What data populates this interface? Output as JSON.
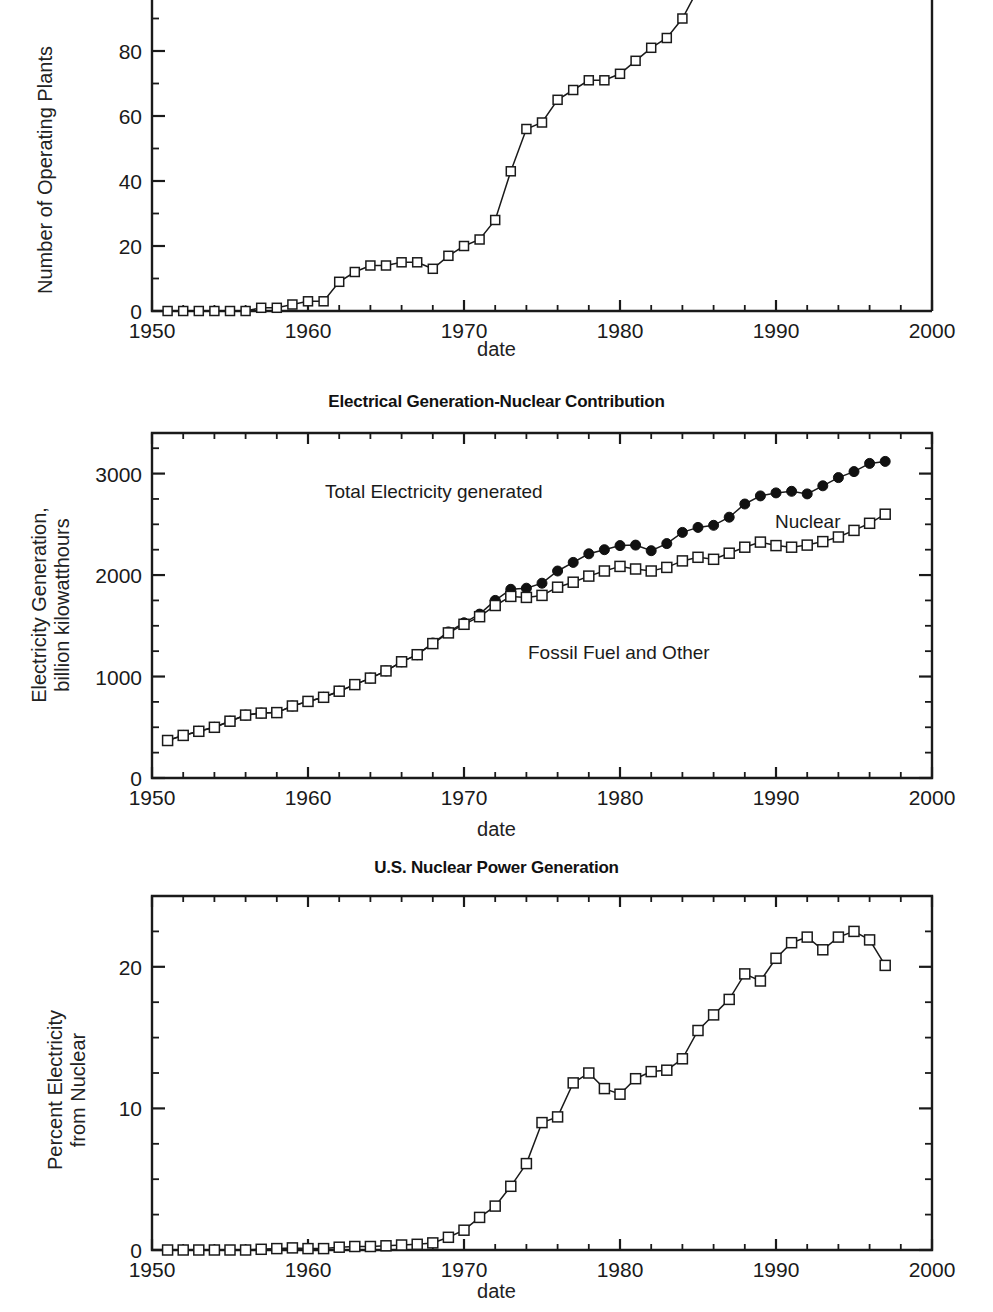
{
  "figure": {
    "background": "#ffffff",
    "line_color": "#1a1a1a",
    "marker_open_fill": "#ffffff",
    "marker_solid_fill": "#111111",
    "xlabel": "date"
  },
  "panels": [
    {
      "id": "operating-plants",
      "title": "",
      "xlabel": "date",
      "ylabel": "Number of Operating Plants",
      "ylabel_lines": [
        "Number of Operating Plants"
      ]
    },
    {
      "id": "electrical-generation",
      "title": "Electrical Generation-Nuclear Contribution",
      "xlabel": "date",
      "ylabel": "Electricity Generation, billion kilowatthours",
      "ylabel_lines": [
        "Electricity Generation,",
        "billion kilowatthours"
      ],
      "annotations": [
        {
          "name": "total-electricity-label",
          "text": "Total Electricity generated"
        },
        {
          "name": "nuclear-label",
          "text": "Nuclear"
        },
        {
          "name": "fossil-fuel-label",
          "text": "Fossil Fuel and Other"
        }
      ]
    },
    {
      "id": "nuclear-percent",
      "title": "U.S. Nuclear Power Generation",
      "xlabel": "date",
      "ylabel": "Percent Electricity from Nuclear",
      "ylabel_lines": [
        "Percent Electricity",
        "from Nuclear"
      ]
    }
  ],
  "chart_data": [
    {
      "type": "line",
      "id": "operating-plants",
      "title": "",
      "xlabel": "date",
      "ylabel": "Number of Operating Plants",
      "xlim": [
        1950,
        2000
      ],
      "ylim": [
        0,
        108
      ],
      "xticks": [
        1950,
        1960,
        1970,
        1980,
        1990,
        2000
      ],
      "xticklabels": [
        "1950",
        "1960",
        "1970",
        "1980",
        "1990",
        "2000"
      ],
      "yticks": [
        0,
        20,
        40,
        60,
        80,
        100
      ],
      "yticklabels": [
        "0",
        "20",
        "40",
        "60",
        "80",
        "100"
      ],
      "yminorstep": 10,
      "grid": false,
      "marker": "open-square",
      "series": [
        {
          "name": "Number of Operating Plants",
          "x": [
            1951,
            1952,
            1953,
            1954,
            1955,
            1956,
            1957,
            1958,
            1959,
            1960,
            1961,
            1962,
            1963,
            1964,
            1965,
            1966,
            1967,
            1968,
            1969,
            1970,
            1971,
            1972,
            1973,
            1974,
            1975,
            1976,
            1977,
            1978,
            1979,
            1980,
            1981,
            1982,
            1983,
            1984,
            1985,
            1986
          ],
          "values": [
            0,
            0,
            0,
            0,
            0,
            0,
            1,
            1,
            2,
            3,
            3,
            9,
            12,
            14,
            14,
            15,
            15,
            13,
            17,
            20,
            22,
            28,
            43,
            56,
            58,
            65,
            68,
            71,
            71,
            73,
            77,
            81,
            84,
            90,
            99,
            104
          ]
        }
      ]
    },
    {
      "type": "line",
      "id": "electrical-generation",
      "title": "Electrical Generation-Nuclear Contribution",
      "xlabel": "date",
      "ylabel": "Electricity Generation, billion kilowatthours",
      "xlim": [
        1950,
        2000
      ],
      "ylim": [
        0,
        3400
      ],
      "xticks": [
        1950,
        1960,
        1970,
        1980,
        1990,
        2000
      ],
      "xticklabels": [
        "1950",
        "1960",
        "1970",
        "1980",
        "1990",
        "2000"
      ],
      "yticks": [
        0,
        1000,
        2000,
        3000
      ],
      "yticklabels": [
        "0",
        "1000",
        "2000",
        "3000"
      ],
      "yminorstep": 250,
      "grid": false,
      "legend_position": "inline-annotations",
      "series": [
        {
          "name": "Total Electricity generated",
          "marker": "solid-circle",
          "x": [
            1951,
            1952,
            1953,
            1954,
            1955,
            1956,
            1957,
            1958,
            1959,
            1960,
            1961,
            1962,
            1963,
            1964,
            1965,
            1966,
            1967,
            1968,
            1969,
            1970,
            1971,
            1972,
            1973,
            1974,
            1975,
            1976,
            1977,
            1978,
            1979,
            1980,
            1981,
            1982,
            1983,
            1984,
            1985,
            1986,
            1987,
            1988,
            1989,
            1990,
            1991,
            1992,
            1993,
            1994,
            1995,
            1996,
            1997
          ],
          "values": [
            370,
            420,
            460,
            500,
            560,
            620,
            640,
            645,
            710,
            755,
            795,
            855,
            920,
            985,
            1055,
            1145,
            1215,
            1330,
            1440,
            1530,
            1615,
            1750,
            1860,
            1870,
            1920,
            2040,
            2125,
            2210,
            2250,
            2290,
            2295,
            2240,
            2310,
            2420,
            2470,
            2490,
            2570,
            2700,
            2780,
            2810,
            2825,
            2800,
            2880,
            2960,
            3020,
            3100,
            3120
          ]
        },
        {
          "name": "Fossil Fuel and Other",
          "marker": "open-square",
          "x": [
            1951,
            1952,
            1953,
            1954,
            1955,
            1956,
            1957,
            1958,
            1959,
            1960,
            1961,
            1962,
            1963,
            1964,
            1965,
            1966,
            1967,
            1968,
            1969,
            1970,
            1971,
            1972,
            1973,
            1974,
            1975,
            1976,
            1977,
            1978,
            1979,
            1980,
            1981,
            1982,
            1983,
            1984,
            1985,
            1986,
            1987,
            1988,
            1989,
            1990,
            1991,
            1992,
            1993,
            1994,
            1995,
            1996,
            1997
          ],
          "values": [
            370,
            420,
            460,
            500,
            560,
            620,
            640,
            645,
            710,
            755,
            795,
            855,
            920,
            985,
            1055,
            1145,
            1215,
            1325,
            1430,
            1515,
            1590,
            1700,
            1790,
            1780,
            1800,
            1880,
            1930,
            1990,
            2040,
            2085,
            2060,
            2040,
            2075,
            2140,
            2175,
            2155,
            2215,
            2275,
            2325,
            2290,
            2275,
            2295,
            2330,
            2375,
            2440,
            2510,
            2600
          ]
        }
      ]
    },
    {
      "type": "line",
      "id": "nuclear-percent",
      "title": "U.S. Nuclear Power Generation",
      "xlabel": "date",
      "ylabel": "Percent Electricity from Nuclear",
      "xlim": [
        1950,
        2000
      ],
      "ylim": [
        0,
        25
      ],
      "xticks": [
        1950,
        1960,
        1970,
        1980,
        1990,
        2000
      ],
      "xticklabels": [
        "1950",
        "1960",
        "1970",
        "1980",
        "1990",
        "2000"
      ],
      "yticks": [
        0,
        10,
        20
      ],
      "yticklabels": [
        "0",
        "10",
        "20"
      ],
      "yminorstep": 2.5,
      "grid": false,
      "marker": "open-square",
      "series": [
        {
          "name": "Percent Electricity from Nuclear",
          "x": [
            1951,
            1952,
            1953,
            1954,
            1955,
            1956,
            1957,
            1958,
            1959,
            1960,
            1961,
            1962,
            1963,
            1964,
            1965,
            1966,
            1967,
            1968,
            1969,
            1970,
            1971,
            1972,
            1973,
            1974,
            1975,
            1976,
            1977,
            1978,
            1979,
            1980,
            1981,
            1982,
            1983,
            1984,
            1985,
            1986,
            1987,
            1988,
            1989,
            1990,
            1991,
            1992,
            1993,
            1994,
            1995,
            1996,
            1997
          ],
          "values": [
            0,
            0,
            0,
            0,
            0,
            0,
            0.05,
            0.1,
            0.15,
            0.1,
            0.1,
            0.2,
            0.25,
            0.25,
            0.3,
            0.35,
            0.4,
            0.5,
            0.9,
            1.4,
            2.3,
            3.1,
            4.5,
            6.1,
            9,
            9.4,
            11.8,
            12.5,
            11.4,
            11,
            12.1,
            12.6,
            12.7,
            13.5,
            15.5,
            16.6,
            17.7,
            19.5,
            19,
            20.6,
            21.7,
            22.1,
            21.2,
            22.1,
            22.5,
            21.9,
            20.1
          ]
        }
      ]
    }
  ]
}
